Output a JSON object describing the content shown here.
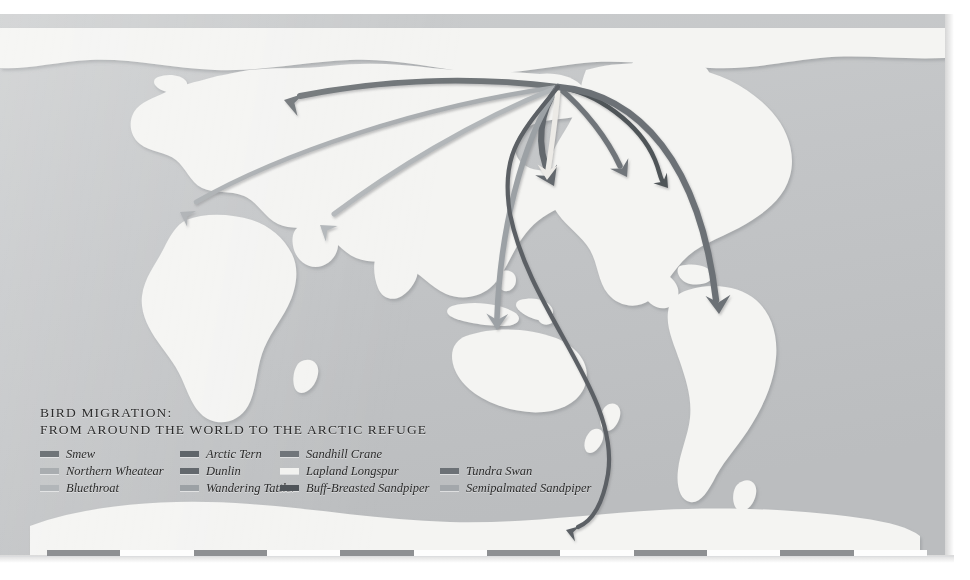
{
  "title": {
    "line1": "BIRD MIGRATION:",
    "line2": "FROM AROUND THE WORLD TO THE ARCTIC REFUGE"
  },
  "legend": {
    "columns": 4,
    "rows": [
      [
        {
          "label": "Smew",
          "color": "#6f7478",
          "has_swatch": true
        },
        {
          "label": "Arctic Tern",
          "color": "#5f656a",
          "has_swatch": true
        },
        {
          "label": "Sandhill Crane",
          "color": "#70757a",
          "has_swatch": true
        },
        {
          "label": "",
          "color": "",
          "has_swatch": false
        }
      ],
      [
        {
          "label": "Northern Wheatear",
          "color": "#a9adb0",
          "has_swatch": true
        },
        {
          "label": "Dunlin",
          "color": "#63686d",
          "has_swatch": true
        },
        {
          "label": "Lapland Longspur",
          "color": "#f2f2f0",
          "has_swatch": true
        },
        {
          "label": "Tundra Swan",
          "color": "#6c7176",
          "has_swatch": true
        }
      ],
      [
        {
          "label": "Bluethroat",
          "color": "#b2b6b9",
          "has_swatch": true
        },
        {
          "label": "Wandering Tattler",
          "color": "#9ca1a5",
          "has_swatch": true
        },
        {
          "label": "Buff-Breasted Sandpiper",
          "color": "#4f5459",
          "has_swatch": true
        },
        {
          "label": "Semipalmated Sandpiper",
          "color": "#a3a7ab",
          "has_swatch": true
        }
      ]
    ]
  },
  "map": {
    "projection_note": "world map, Arctic Refuge convergence point",
    "ocean_color": "#c2c4c6",
    "land_color": "#f4f4f2",
    "land_shadow_color": "#b3b5b7",
    "origin_point": {
      "x": 558,
      "y": 73,
      "name": "arctic-refuge"
    },
    "routes": [
      {
        "species": "Smew",
        "color": "#6f7478",
        "width": 6.0,
        "dest_name": "siberia",
        "path": "M558,73 C470,62 380,66 300,82",
        "arrow": {
          "x": 284,
          "y": 86,
          "angle": 196
        }
      },
      {
        "species": "Northern Wheatear",
        "color": "#a9adb0",
        "width": 4.6,
        "dest_name": "west-africa",
        "path": "M558,73 C420,92 280,140 196,188",
        "arrow": {
          "x": 180,
          "y": 198,
          "angle": 210
        }
      },
      {
        "species": "Bluethroat",
        "color": "#b2b6b9",
        "width": 5.0,
        "dest_name": "south-asia",
        "path": "M558,73 C470,108 390,158 334,200",
        "arrow": {
          "x": 320,
          "y": 211,
          "angle": 217
        }
      },
      {
        "species": "Dunlin",
        "color": "#63686d",
        "width": 6.2,
        "dest_name": "east-asia",
        "path": "M558,73 C540,96 535,132 550,162",
        "arrow": {
          "x": 554,
          "y": 172,
          "angle": 64
        }
      },
      {
        "species": "Wandering Tattler",
        "color": "#9ca1a5",
        "width": 5.6,
        "dest_name": "australasia",
        "path": "M558,73 C520,130 500,220 497,304",
        "arrow": {
          "x": 497,
          "y": 316,
          "angle": 91
        }
      },
      {
        "species": "Sandhill Crane",
        "color": "#70757a",
        "width": 5.4,
        "dest_name": "central-america",
        "path": "M558,73 C586,96 608,126 620,152",
        "arrow": {
          "x": 627,
          "y": 163,
          "angle": 60
        }
      },
      {
        "species": "Lapland Longspur",
        "color": "#eceae6",
        "width": 5.2,
        "dest_name": "great-plains",
        "path": "M558,73 C556,104 552,130 548,156",
        "arrow": {
          "x": 547,
          "y": 166,
          "angle": 93
        }
      },
      {
        "species": "Buff-Breasted Sandpiper",
        "color": "#4f5459",
        "width": 4.4,
        "dest_name": "us-east-coast",
        "path": "M558,73 C596,78 640,110 655,146 C660,158 660,164 663,168",
        "arrow": {
          "x": 668,
          "y": 174,
          "angle": 52
        }
      },
      {
        "species": "Tundra Swan",
        "color": "#6c7176",
        "width": 6.4,
        "dest_name": "brazil",
        "path": "M558,73 C640,80 700,150 716,286",
        "arrow": {
          "x": 719,
          "y": 300,
          "angle": 87
        }
      },
      {
        "species": "Semipalmated Sandpiper",
        "color": "#5b6065",
        "width": 4.2,
        "dest_name": "antarctica",
        "path": "M558,73 C520,120 500,140 510,200 C530,300 620,380 608,460 C602,495 590,508 578,513",
        "arrow": {
          "x": 566,
          "y": 516,
          "angle": 198
        }
      }
    ]
  },
  "scalebar": {
    "segments": 12,
    "dark_color": "#8e9093",
    "light_color": "#fdfdfd"
  }
}
